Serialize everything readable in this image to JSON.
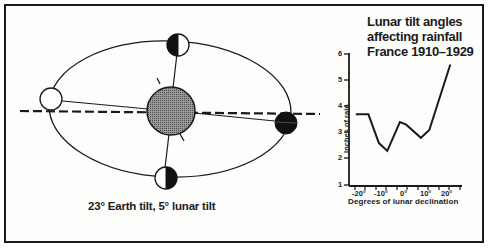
{
  "diagram": {
    "caption": "23° Earth tilt, 5° lunar tilt",
    "elements": {
      "earth": "Earth (hatched sphere, center)",
      "moon_positions": [
        "full moon (left, white)",
        "first quarter (top, half-shaded)",
        "new moon (right, dark)",
        "last quarter (bottom, half-shaded)"
      ],
      "orbit": "elliptical lunar orbit",
      "reference_line": "dashed ecliptic/equatorial plane line"
    }
  },
  "chart_data": {
    "type": "line",
    "title": "Lunar tilt angles affecting rainfall France 1910–1929",
    "title_lines": [
      "Lunar tilt angles",
      "affecting rainfall",
      "France 1910–1929"
    ],
    "xlabel": "Degrees of lunar declination",
    "ylabel": "Inches of rain",
    "x_tick_labels": [
      "-20°",
      "-10°",
      "0°",
      "10°",
      "20°"
    ],
    "y_tick_labels": [
      "1",
      "2",
      "3",
      "4",
      "5",
      "6"
    ],
    "ylim": [
      1,
      6
    ],
    "xlim": [
      -24,
      24
    ],
    "grid": false,
    "series": [
      {
        "name": "Rainfall",
        "x": [
          -22,
          -16,
          -11,
          -7,
          -1,
          2,
          9,
          13,
          23
        ],
        "y": [
          3.7,
          3.7,
          2.6,
          2.3,
          3.4,
          3.3,
          2.8,
          3.1,
          5.6
        ]
      }
    ]
  },
  "colors": {
    "ink": "#1a1a1a",
    "earth_fill": "#8a8a8a",
    "background": "#fdfdfb"
  }
}
